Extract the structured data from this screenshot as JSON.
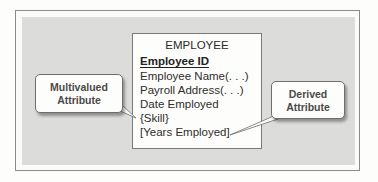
{
  "entity": {
    "name": "EMPLOYEE",
    "attributes": [
      {
        "label": "Employee ID",
        "type": "identifier"
      },
      {
        "label": "Employee Name(. . .)",
        "type": "composite"
      },
      {
        "label": "Payroll Address(. . .)",
        "type": "composite"
      },
      {
        "label": "Date Employed",
        "type": "simple"
      },
      {
        "label": "{Skill}",
        "type": "multivalued"
      },
      {
        "label": "[Years Employed]",
        "type": "derived"
      }
    ]
  },
  "callouts": {
    "multivalued": {
      "line1": "Multivalued",
      "line2": "Attribute",
      "points_to": "{Skill}"
    },
    "derived": {
      "line1": "Derived",
      "line2": "Attribute",
      "points_to": "[Years Employed]"
    }
  },
  "colors": {
    "panel": "#dcdcda",
    "border": "#8a8a88",
    "text": "#2e2e2e",
    "callout_text": "#4a4a4a"
  }
}
